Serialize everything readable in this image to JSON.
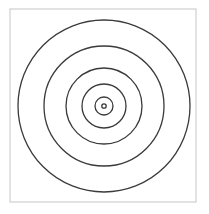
{
  "figure": {
    "frame": {
      "x": 10,
      "y": 9,
      "width": 186,
      "height": 193,
      "stroke": "#cfcfcf"
    },
    "center": {
      "x": 104,
      "y": 106
    },
    "circle_stroke": "#3a3a3a",
    "circles": [
      {
        "r": 86
      },
      {
        "r": 60
      },
      {
        "r": 38
      },
      {
        "r": 22
      },
      {
        "r": 9
      },
      {
        "r": 2.2
      }
    ]
  }
}
